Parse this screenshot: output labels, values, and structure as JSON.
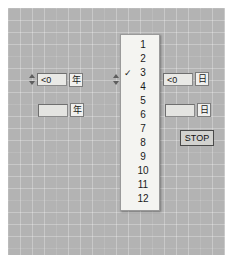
{
  "panel": {
    "background_color": "#b3b3b3",
    "grid": true
  },
  "controls": {
    "year_display": {
      "value": "<0",
      "unit_label": "年",
      "spinner": true
    },
    "year_input": {
      "value": "",
      "unit_label": "年",
      "spinner": false
    },
    "month_display": {
      "value": "",
      "unit_label": "",
      "spinner": true
    },
    "day_display": {
      "value": "<0",
      "unit_label": "日",
      "spinner": false
    },
    "day_input": {
      "value": "",
      "unit_label": "日",
      "spinner": false
    }
  },
  "dropdown": {
    "name": "month-ring-list",
    "selected_value": "3",
    "check_glyph": "✓",
    "items": [
      {
        "label": "1",
        "checked": false
      },
      {
        "label": "2",
        "checked": false
      },
      {
        "label": "3",
        "checked": true
      },
      {
        "label": "4",
        "checked": false
      },
      {
        "label": "5",
        "checked": false
      },
      {
        "label": "6",
        "checked": false
      },
      {
        "label": "7",
        "checked": false
      },
      {
        "label": "8",
        "checked": false
      },
      {
        "label": "9",
        "checked": false
      },
      {
        "label": "10",
        "checked": false
      },
      {
        "label": "11",
        "checked": false
      },
      {
        "label": "12",
        "checked": false
      }
    ]
  },
  "buttons": {
    "stop_label": "STOP"
  }
}
